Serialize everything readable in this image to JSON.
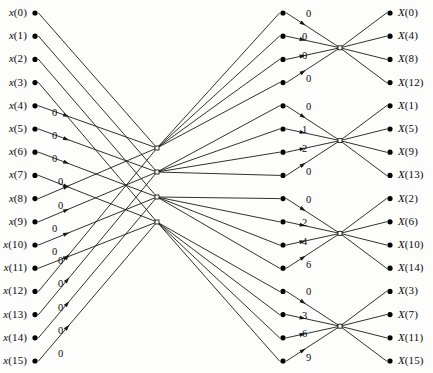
{
  "figure": {
    "type": "signal-flow-graph",
    "name": "16-point radix-4 FFT butterfly flow graph",
    "width": 433,
    "height": 373,
    "stroke_color": "#1a1a1a",
    "node_color": "#000000",
    "background_color": "#ffffff"
  },
  "inputs": {
    "count": 16,
    "labels": [
      "x(0)",
      "x(1)",
      "x(2)",
      "x(3)",
      "x(4)",
      "x(5)",
      "x(6)",
      "x(7)",
      "x(8)",
      "x(9)",
      "x(10)",
      "x(11)",
      "x(12)",
      "x(13)",
      "x(14)",
      "x(15)"
    ],
    "indices": [
      0,
      1,
      2,
      3,
      4,
      5,
      6,
      7,
      8,
      9,
      10,
      11,
      12,
      13,
      14,
      15
    ]
  },
  "outputs": {
    "count": 16,
    "labels": [
      "X(0)",
      "X(4)",
      "X(8)",
      "X(12)",
      "X(1)",
      "X(5)",
      "X(9)",
      "X(13)",
      "X(2)",
      "X(6)",
      "X(10)",
      "X(14)",
      "X(3)",
      "X(7)",
      "X(11)",
      "X(15)"
    ],
    "indices": [
      0,
      4,
      8,
      12,
      1,
      5,
      9,
      13,
      2,
      6,
      10,
      14,
      3,
      7,
      11,
      15
    ]
  },
  "stage1": {
    "description": "First stage twiddle exponents on the 12 lower input branches",
    "twiddle_labels": [
      "0",
      "0",
      "0",
      "0",
      "0",
      "0",
      "0",
      "0",
      "0",
      "0",
      "0",
      "0"
    ],
    "label_rows": [
      4,
      5,
      6,
      7,
      8,
      9,
      10,
      11,
      12,
      13,
      14,
      15
    ]
  },
  "stage2": {
    "description": "Second stage twiddle exponents, grouped by output butterfly",
    "groups": [
      {
        "group": 0,
        "output_block": [
          "X(0)",
          "X(4)",
          "X(8)",
          "X(12)"
        ],
        "twiddle_labels": [
          "0",
          "0",
          "0",
          "0"
        ]
      },
      {
        "group": 1,
        "output_block": [
          "X(1)",
          "X(5)",
          "X(9)",
          "X(13)"
        ],
        "twiddle_labels": [
          "0",
          "1",
          "2",
          "0"
        ]
      },
      {
        "group": 2,
        "output_block": [
          "X(2)",
          "X(6)",
          "X(10)",
          "X(14)"
        ],
        "twiddle_labels": [
          "0",
          "2",
          "4",
          "6"
        ]
      },
      {
        "group": 3,
        "output_block": [
          "X(3)",
          "X(7)",
          "X(11)",
          "X(15)"
        ],
        "twiddle_labels": [
          "0",
          "3",
          "6",
          "9"
        ]
      }
    ]
  },
  "hubs": {
    "description": "Crossover hub nodes in the middle of the interconnect region",
    "count": 4,
    "x": 157,
    "y": [
      148,
      172,
      197,
      222
    ]
  },
  "columns": {
    "input_node_x": 35,
    "mid_node_x": 283,
    "output_node_x": 390,
    "input_label_x": 4,
    "output_label_x": 398,
    "row_top_y": 13,
    "row_spacing": 23.2
  }
}
